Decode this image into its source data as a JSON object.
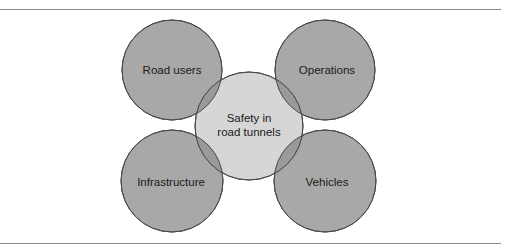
{
  "diagram": {
    "center": {
      "label_line1": "Safety in",
      "label_line2": "road tunnels",
      "fill": "#d6d6d6"
    },
    "nodes": [
      {
        "id": "road-users",
        "label": "Road users"
      },
      {
        "id": "operations",
        "label": "Operations"
      },
      {
        "id": "infrastructure",
        "label": "Infrastructure"
      },
      {
        "id": "vehicles",
        "label": "Vehicles"
      }
    ],
    "colors": {
      "outer_fill": "#a8a8a8",
      "center_fill": "#d6d6d6",
      "overlap_fill": "#9a9a9a",
      "stroke": "#4a4a4a",
      "rule": "#8a8a8a"
    }
  }
}
